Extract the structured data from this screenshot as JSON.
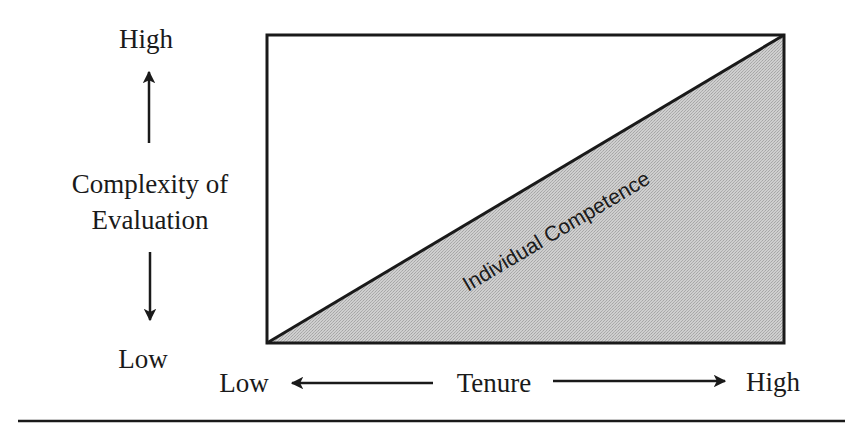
{
  "figure": {
    "y_axis": {
      "title_line1": "Complexity of",
      "title_line2": "Evaluation",
      "high_label": "High",
      "low_label": "Low"
    },
    "x_axis": {
      "title": "Tenure",
      "low_label": "Low",
      "high_label": "High"
    },
    "region_label": "Individual Competence",
    "colors": {
      "line": "#1a1a1a",
      "fill": "#c9c9c9",
      "fill_dot": "#a8a8a8",
      "background": "#ffffff"
    }
  }
}
